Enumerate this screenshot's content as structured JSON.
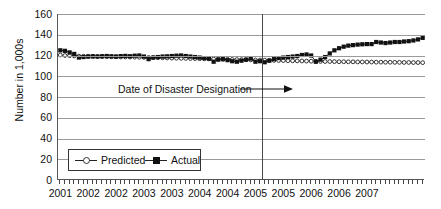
{
  "chart_data": {
    "type": "line",
    "title": "",
    "xlabel": "",
    "ylabel": "Number in 1,000s",
    "ylim": [
      0,
      160
    ],
    "yticks": [
      0,
      20,
      40,
      60,
      80,
      100,
      120,
      140,
      160
    ],
    "grid": true,
    "legend_position": "inside-bottom-left",
    "x_tick_labels": [
      "2001",
      "2002",
      "2002",
      "2003",
      "2003",
      "2004",
      "2004",
      "2005",
      "2005",
      "2006",
      "2006",
      "2007"
    ],
    "x_label_positions": [
      0,
      6,
      12,
      18,
      24,
      30,
      36,
      42,
      48,
      54,
      60,
      66
    ],
    "x_minor_ticks": 79,
    "annotations": [
      {
        "text": "Date of Disaster Designation",
        "arrow": "right",
        "points_to": "vertical-line",
        "x_index": 43,
        "y_value": 88
      }
    ],
    "vertical_marker": {
      "label": "Date of Disaster Designation",
      "x_index": 43.5
    },
    "series": [
      {
        "name": "Predicted",
        "marker": "open-circle",
        "color": "#333333",
        "values": [
          120.5,
          120.0,
          119.8,
          119.6,
          119.4,
          119.3,
          119.2,
          119.1,
          119.0,
          118.9,
          118.8,
          118.8,
          118.7,
          118.6,
          118.6,
          118.5,
          118.4,
          118.3,
          118.2,
          118.1,
          118.0,
          117.9,
          117.8,
          117.6,
          117.5,
          117.4,
          117.3,
          117.2,
          117.1,
          117.0,
          116.9,
          116.8,
          116.7,
          116.6,
          116.5,
          116.4,
          116.3,
          116.2,
          116.1,
          116.0,
          115.9,
          115.8,
          115.7,
          115.6,
          115.5,
          115.4,
          115.3,
          115.2,
          115.1,
          115.0,
          114.9,
          114.8,
          114.7,
          114.6,
          114.5,
          114.4,
          114.3,
          114.2,
          114.2,
          114.1,
          114.0,
          114.0,
          113.9,
          113.9,
          113.8,
          113.8,
          113.7,
          113.7,
          113.6,
          113.6,
          113.5,
          113.5,
          113.4,
          113.4,
          113.3,
          113.3,
          113.2,
          113.2,
          113.1
        ]
      },
      {
        "name": "Actual",
        "marker": "filled-square",
        "color": "#111111",
        "values": [
          125.0,
          124.5,
          123.0,
          121.5,
          118.0,
          118.5,
          119.0,
          119.2,
          119.0,
          119.3,
          119.5,
          119.2,
          119.0,
          119.4,
          119.6,
          119.3,
          119.8,
          120.0,
          119.0,
          116.5,
          118.0,
          118.5,
          119.0,
          119.2,
          119.5,
          119.8,
          120.0,
          119.5,
          119.0,
          118.5,
          118.0,
          117.5,
          117.0,
          114.0,
          116.0,
          116.5,
          115.5,
          114.5,
          114.0,
          115.0,
          116.0,
          117.0,
          114.0,
          114.5,
          113.5,
          115.0,
          116.5,
          117.5,
          118.0,
          118.5,
          119.0,
          119.5,
          120.5,
          121.0,
          120.0,
          114.0,
          116.0,
          118.5,
          122.0,
          125.0,
          127.0,
          128.5,
          129.5,
          130.0,
          130.5,
          130.8,
          131.0,
          131.0,
          133.0,
          132.5,
          132.0,
          132.5,
          133.0,
          133.0,
          133.5,
          133.8,
          134.5,
          135.5,
          137.0
        ]
      }
    ]
  },
  "axis": {
    "y_title": "Number in 1,000s"
  },
  "legend": {
    "predicted_label": "Predicted",
    "actual_label": "Actual"
  }
}
